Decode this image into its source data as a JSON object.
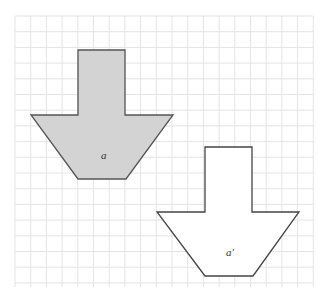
{
  "diagram": {
    "type": "geometric-translation-on-grid",
    "grid": {
      "x0": 15,
      "y0": 16,
      "x1": 313,
      "y1": 287,
      "cell": 15.7,
      "line_color": "#e4e4e4"
    },
    "shapes": [
      {
        "id": "a",
        "label": "a",
        "fill": "#d3d3d3",
        "stroke": "#555555",
        "points": "78,50 125,50 125,115 173,115 126,179 78,179 31,115 78,115",
        "label_pos": {
          "x": 101,
          "y": 159
        }
      },
      {
        "id": "a-prime",
        "label": "a′",
        "fill": "#ffffff",
        "stroke": "#444444",
        "points": "205,147 252,147 252,212 299,212 253,276 205,276 157,212 205,212",
        "label_pos": {
          "x": 226,
          "y": 256
        }
      }
    ]
  }
}
